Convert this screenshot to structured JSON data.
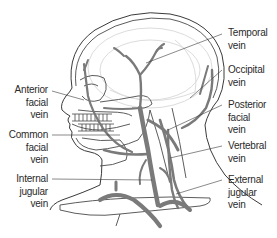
{
  "diagram": {
    "colors": {
      "outline": "#3a3a3a",
      "vein": "#7a7a7a",
      "skull": "#9a9a9a",
      "faint": "#d4d4d4",
      "background": "#ffffff"
    },
    "labels": {
      "left": [
        {
          "id": "anterior-facial-vein",
          "lines": [
            "Anterior",
            "facial",
            "vein"
          ]
        },
        {
          "id": "common-facial-vein",
          "lines": [
            "Common",
            "facial",
            "vein"
          ]
        },
        {
          "id": "internal-jugular-vein",
          "lines": [
            "Internal",
            "jugular",
            "vein"
          ]
        }
      ],
      "right": [
        {
          "id": "temporal-vein",
          "lines": [
            "Temporal",
            "vein"
          ]
        },
        {
          "id": "occipital-vein",
          "lines": [
            "Occipital",
            "vein"
          ]
        },
        {
          "id": "posterior-facial-vein",
          "lines": [
            "Posterior",
            "facial",
            "vein"
          ]
        },
        {
          "id": "vertebral-vein",
          "lines": [
            "Vertebral",
            "vein"
          ]
        },
        {
          "id": "external-jugular-vein",
          "lines": [
            "External",
            "jugular",
            "vein"
          ]
        }
      ]
    }
  }
}
